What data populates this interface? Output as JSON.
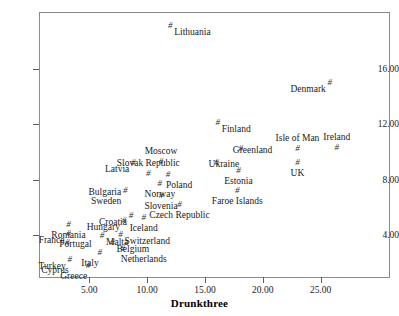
{
  "figure": {
    "clipped_title": "",
    "xaxis_title": "Drunkthree"
  },
  "axes": {
    "y_ticklabels": [
      "16.00",
      "12.00",
      "8.00",
      "4.00"
    ],
    "x_ticklabels": [
      "5.00",
      "10.00",
      "15.00",
      "20.00",
      "25.00"
    ]
  },
  "chart_data": {
    "type": "scatter",
    "title": "",
    "xlabel": "Drunkthree",
    "ylabel": "",
    "xlim": [
      0.65,
      31.0
    ],
    "ylim": [
      0.9,
      20.1
    ],
    "xticks": [
      5,
      10,
      15,
      20,
      25
    ],
    "yticks": [
      4,
      8,
      12,
      16
    ],
    "xticklabels": [
      "5.00",
      "10.00",
      "15.00",
      "20.00",
      "25.00"
    ],
    "yticklabels": [
      "4.00",
      "8.00",
      "12.00",
      "16.00"
    ],
    "grid": false,
    "legend": "none",
    "marker": "#",
    "points": [
      {
        "label": "Lithuania",
        "x": 12.0,
        "y": 19.1,
        "pos": "right"
      },
      {
        "label": "Denmark",
        "x": 25.8,
        "y": 15.0,
        "pos": "left"
      },
      {
        "label": "Finland",
        "x": 16.1,
        "y": 12.1,
        "pos": "right"
      },
      {
        "label": "Greenland",
        "x": 18.1,
        "y": 10.2,
        "pos": "over"
      },
      {
        "label": "Isle of Man",
        "x": 23.0,
        "y": 10.2,
        "pos": "above"
      },
      {
        "label": "Ireland",
        "x": 26.4,
        "y": 10.3,
        "pos": "above"
      },
      {
        "label": "Moscow",
        "x": 11.2,
        "y": 9.3,
        "pos": "above"
      },
      {
        "label": "Latvia",
        "x": 8.8,
        "y": 9.2,
        "pos": "left"
      },
      {
        "label": "Ukraine",
        "x": 16.0,
        "y": 9.2,
        "pos": "over"
      },
      {
        "label": "UK",
        "x": 23.0,
        "y": 9.2,
        "pos": "below"
      },
      {
        "label": "Slovak Republic",
        "x": 10.1,
        "y": 8.4,
        "pos": "above"
      },
      {
        "label": "Poland",
        "x": 11.8,
        "y": 8.3,
        "pos": "belowright"
      },
      {
        "label": "Estonia",
        "x": 17.9,
        "y": 8.6,
        "pos": "below"
      },
      {
        "label": "Norway",
        "x": 11.1,
        "y": 7.7,
        "pos": "below"
      },
      {
        "label": "Bulgaria",
        "x": 8.1,
        "y": 7.2,
        "pos": "leftstack"
      },
      {
        "label": "Sweden",
        "x": 8.1,
        "y": 7.2,
        "pos": "leftstack2"
      },
      {
        "label": "Slovenia",
        "x": 11.2,
        "y": 6.8,
        "pos": "below"
      },
      {
        "label": "Faroe Islands",
        "x": 17.8,
        "y": 7.2,
        "pos": "below"
      },
      {
        "label": "Czech Republic",
        "x": 12.8,
        "y": 6.2,
        "pos": "below"
      },
      {
        "label": "Croatia",
        "x": 8.6,
        "y": 5.4,
        "pos": "left"
      },
      {
        "label": "Iceland",
        "x": 9.7,
        "y": 5.2,
        "pos": "below"
      },
      {
        "label": "Hungary",
        "x": 8.0,
        "y": 5.0,
        "pos": "left"
      },
      {
        "label": "Romania",
        "x": 3.2,
        "y": 4.7,
        "pos": "below"
      },
      {
        "label": "France",
        "x": 3.2,
        "y": 4.1,
        "pos": "left"
      },
      {
        "label": "Switzerland",
        "x": 7.7,
        "y": 4.0,
        "pos": "right"
      },
      {
        "label": "Malta",
        "x": 6.1,
        "y": 3.9,
        "pos": "right"
      },
      {
        "label": "Portugal",
        "x": 3.1,
        "y": 3.4,
        "pos": "over"
      },
      {
        "label": "Belgium",
        "x": 7.0,
        "y": 3.4,
        "pos": "right"
      },
      {
        "label": "Netherlands",
        "x": 7.9,
        "y": 3.0,
        "pos": "belowright"
      },
      {
        "label": "Italy",
        "x": 5.9,
        "y": 2.7,
        "pos": "belowleft"
      },
      {
        "label": "Turkey",
        "x": 3.3,
        "y": 2.2,
        "pos": "left"
      },
      {
        "label": "Cyprus",
        "x": 3.3,
        "y": 2.2,
        "pos": "belowleft"
      },
      {
        "label": "Greece",
        "x": 4.9,
        "y": 1.8,
        "pos": "belowleft"
      }
    ]
  }
}
